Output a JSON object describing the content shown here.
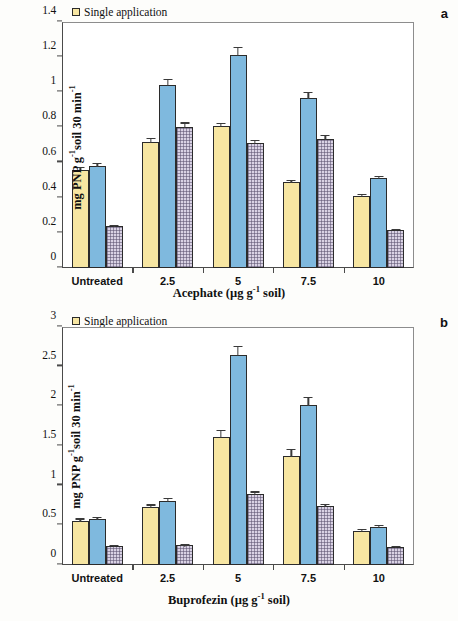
{
  "figure": {
    "panels": [
      {
        "letter": "a",
        "legend": [
          {
            "label": "Single application",
            "series": "single",
            "color": "#f7e6a2"
          },
          {
            "label": "Two applications",
            "series": "two",
            "color": "#7fb9de"
          },
          {
            "label": "Three applications",
            "series": "three",
            "color": "#d9d2e4"
          }
        ],
        "ylabel_parts": {
          "pre": "mg PNP g",
          "sup1": "-1",
          "mid": "soil 30 min",
          "sup2": "-1"
        },
        "xlabel_parts": {
          "pre": "Acephate (µg g",
          "sup": "-1",
          "post": " soil)"
        },
        "yticks": [
          "0",
          "0.2",
          "0.4",
          "0.6",
          "0.8",
          "1",
          "1.2",
          "1.4"
        ]
      },
      {
        "letter": "b",
        "legend": [
          {
            "label": "Single application",
            "series": "single",
            "color": "#f7e6a2"
          },
          {
            "label": "Two applications",
            "series": "two",
            "color": "#7fb9de"
          },
          {
            "label": "Three applications",
            "series": "three",
            "color": "#d9d2e4"
          }
        ],
        "ylabel_parts": {
          "pre": "mg PNP g",
          "sup1": "-1",
          "mid": "soil 30 min",
          "sup2": "-1"
        },
        "xlabel_parts": {
          "pre": "Buprofezin (µg g",
          "sup": "-1",
          "post": " soil)"
        },
        "yticks": [
          "0",
          "0.5",
          "1",
          "1.5",
          "2",
          "2.5",
          "3"
        ]
      }
    ]
  },
  "chart_data": [
    {
      "type": "bar",
      "panel": "a",
      "title": "",
      "xlabel": "Acephate (µg g-1 soil)",
      "ylabel": "mg PNP g-1 soil 30 min-1",
      "categories": [
        "Untreated",
        "2.5",
        "5",
        "7.5",
        "10"
      ],
      "ylim": [
        0,
        1.4
      ],
      "yticks": [
        0,
        0.2,
        0.4,
        0.6,
        0.8,
        1.0,
        1.2,
        1.4
      ],
      "grid": false,
      "legend_position": "top-left",
      "series": [
        {
          "name": "Single application",
          "color": "#f7e6a2",
          "values": [
            0.56,
            0.72,
            0.81,
            0.49,
            0.41
          ],
          "errors": [
            0.04,
            0.035,
            0.025,
            0.03,
            0.035
          ]
        },
        {
          "name": "Two applications",
          "color": "#7fb9de",
          "values": [
            0.58,
            1.04,
            1.21,
            0.97,
            0.51
          ],
          "errors": [
            0.045,
            0.045,
            0.055,
            0.045,
            0.04
          ]
        },
        {
          "name": "Three applications",
          "color": "#d9d2e4",
          "values": [
            0.24,
            0.805,
            0.71,
            0.735,
            0.215
          ],
          "errors": [
            0.035,
            0.04,
            0.035,
            0.04,
            0.03
          ]
        }
      ]
    },
    {
      "type": "bar",
      "panel": "b",
      "title": "",
      "xlabel": "Buprofezin (µg g-1 soil)",
      "ylabel": "mg PNP g-1 soil 30 min-1",
      "categories": [
        "Untreated",
        "2.5",
        "5",
        "7.5",
        "10"
      ],
      "ylim": [
        0,
        3
      ],
      "yticks": [
        0,
        0.5,
        1.0,
        1.5,
        2.0,
        2.5,
        3.0
      ],
      "grid": false,
      "legend_position": "top-left",
      "series": [
        {
          "name": "Single application",
          "color": "#f7e6a2",
          "values": [
            0.56,
            0.73,
            1.61,
            1.38,
            0.43
          ],
          "errors": [
            0.14,
            0.14,
            0.17,
            0.18,
            0.14
          ]
        },
        {
          "name": "Two applications",
          "color": "#7fb9de",
          "values": [
            0.58,
            0.81,
            2.65,
            2.02,
            0.48
          ],
          "errors": [
            0.15,
            0.12,
            0.12,
            0.14,
            0.14
          ]
        },
        {
          "name": "Three applications",
          "color": "#d9d2e4",
          "values": [
            0.245,
            0.25,
            0.895,
            0.745,
            0.23
          ],
          "errors": [
            0.09,
            0.09,
            0.1,
            0.1,
            0.09
          ]
        }
      ]
    }
  ]
}
